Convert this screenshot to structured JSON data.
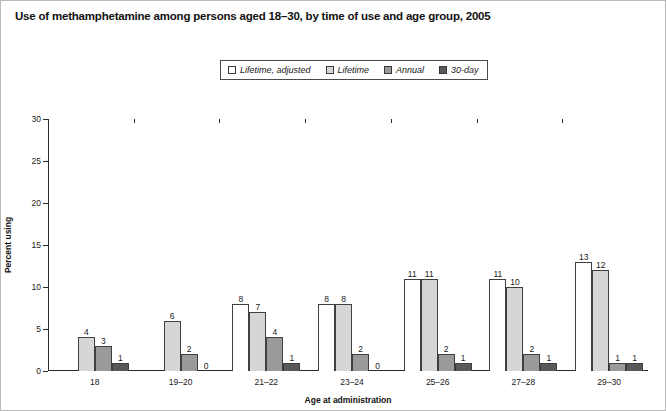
{
  "title": "Use of methamphetamine among persons aged 18–30, by time of use and age group, 2005",
  "legend": {
    "items": [
      {
        "label": "Lifetime, adjusted",
        "color": "#ffffff"
      },
      {
        "label": "Lifetime",
        "color": "#d6d6d6"
      },
      {
        "label": "Annual",
        "color": "#9a9a9a"
      },
      {
        "label": "30-day",
        "color": "#595959"
      }
    ]
  },
  "chart_data": {
    "type": "bar",
    "title": "Use of methamphetamine among persons aged 18–30, by time of use and age group, 2005",
    "xlabel": "Age at administration",
    "ylabel": "Percent using",
    "ylim": [
      0,
      30
    ],
    "yticks": [
      "0",
      "5",
      "10",
      "15",
      "20",
      "25",
      "30"
    ],
    "grid": false,
    "legend_position": "top-center",
    "categories": [
      "18",
      "19–20",
      "21–22",
      "23–24",
      "25–26",
      "27–28",
      "29–30"
    ],
    "series": [
      {
        "name": "Lifetime, adjusted",
        "color": "#ffffff",
        "values": [
          null,
          null,
          8,
          8,
          11,
          11,
          13
        ]
      },
      {
        "name": "Lifetime",
        "color": "#d6d6d6",
        "values": [
          4,
          6,
          7,
          8,
          11,
          10,
          12
        ]
      },
      {
        "name": "Annual",
        "color": "#9a9a9a",
        "values": [
          3,
          2,
          4,
          2,
          2,
          2,
          1
        ]
      },
      {
        "name": "30-day",
        "color": "#595959",
        "values": [
          1,
          0,
          1,
          0,
          1,
          1,
          1
        ]
      }
    ]
  }
}
